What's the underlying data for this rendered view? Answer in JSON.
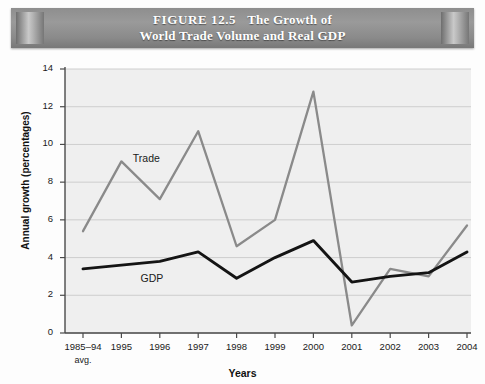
{
  "figure": {
    "number_label": "FIGURE 12.5",
    "title_line1": "The Growth of",
    "title_line2": "World Trade Volume and Real GDP"
  },
  "chart_data": {
    "type": "line",
    "xlabel": "Years",
    "ylabel": "Annual growth (percentages)",
    "categories": [
      "1985–94\navg.",
      "1995",
      "1996",
      "1997",
      "1998",
      "1999",
      "2000",
      "2001",
      "2002",
      "2003",
      "2004"
    ],
    "category_labels": [
      "1985–94",
      "1995",
      "1996",
      "1997",
      "1998",
      "1999",
      "2000",
      "2001",
      "2002",
      "2003",
      "2004"
    ],
    "category_sublabel": "avg.",
    "ylim": [
      0,
      14
    ],
    "yticks": [
      0,
      2,
      4,
      6,
      8,
      10,
      12,
      14
    ],
    "ytick_labels": [
      "0",
      "2",
      "4",
      "6",
      "8",
      "10",
      "12",
      "14"
    ],
    "grid": true,
    "grid_axis": "y",
    "legend": "inline-labels",
    "series": [
      {
        "name": "Trade",
        "color": "#8a8a8a",
        "values": [
          5.4,
          9.1,
          7.1,
          10.7,
          4.6,
          6.0,
          12.8,
          0.4,
          3.4,
          3.0,
          5.7
        ]
      },
      {
        "name": "GDP",
        "color": "#141414",
        "values": [
          3.4,
          3.6,
          3.8,
          4.3,
          2.9,
          4.0,
          4.9,
          2.7,
          3.0,
          3.2,
          4.3
        ]
      }
    ],
    "annotations": [
      {
        "text": "Trade",
        "series": "Trade"
      },
      {
        "text": "GDP",
        "series": "GDP"
      }
    ]
  },
  "colors": {
    "trade_line": "#8a8a8a",
    "gdp_line": "#141414",
    "banner": "#8e8e8e",
    "grid": "#c9c9c9",
    "axis": "#4a4a4a",
    "plot_background": "#efefef"
  }
}
